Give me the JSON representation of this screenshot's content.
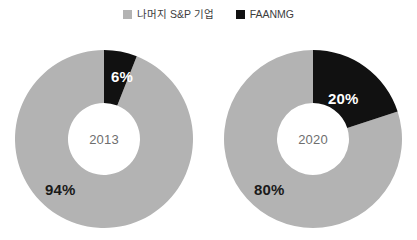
{
  "legend": {
    "position": "top-center",
    "entries": [
      {
        "label": "나머지 S&P 기업",
        "color": "#b3b3b3",
        "swatch": "square-swatch-icon"
      },
      {
        "label": "FAANMG",
        "color": "#111111",
        "swatch": "square-swatch-icon"
      }
    ]
  },
  "charts": [
    {
      "center_label": "2013",
      "labels": {
        "faanmg": "6%",
        "rest": "94%"
      }
    },
    {
      "center_label": "2020",
      "labels": {
        "faanmg": "20%",
        "rest": "80%"
      }
    }
  ],
  "chart_data": {
    "type": "pie",
    "variant": "donut",
    "title": "",
    "subtitle": "",
    "xlabel": "",
    "ylabel": "",
    "grid": false,
    "legend_position": "top-center",
    "legend_entries": [
      "나머지 S&P 기업",
      "FAANMG"
    ],
    "colors": {
      "rest": "#b3b3b3",
      "faanmg": "#111111",
      "hole": "#ffffff"
    },
    "series_names": [
      "나머지 S&P 기업",
      "FAANMG"
    ],
    "charts": [
      {
        "name": "2013",
        "center_label": "2013",
        "categories": [
          "FAANMG",
          "나머지 S&P 기업"
        ],
        "values": [
          6,
          94
        ],
        "data_labels": [
          "6%",
          "94%"
        ],
        "units": "percent",
        "start_angle_deg": 0,
        "direction": "clockwise"
      },
      {
        "name": "2020",
        "center_label": "2020",
        "categories": [
          "FAANMG",
          "나머지 S&P 기업"
        ],
        "values": [
          20,
          80
        ],
        "data_labels": [
          "20%",
          "80%"
        ],
        "units": "percent",
        "start_angle_deg": 0,
        "direction": "clockwise"
      }
    ]
  }
}
